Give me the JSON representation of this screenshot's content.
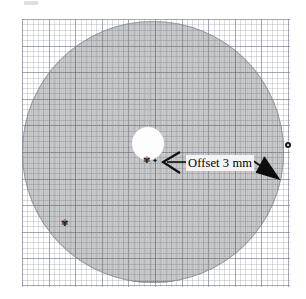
{
  "figure": {
    "caption_text": "",
    "background_color": "#ffffff"
  },
  "annotation": {
    "label": "Offset 3 mm",
    "label_background": "#f4f4f4",
    "label_color": "#000000",
    "left_arrow_name": "arrow-to-hole-edge",
    "right_arrow_name": "arrow-to-disc-edge"
  },
  "grid": {
    "name": "graph-paper-grid",
    "minor_spacing_px": 5.32,
    "major_spacing_px": 26.6,
    "minor_color": "#969ba5",
    "major_color": "#787d87"
  },
  "disc": {
    "name": "specimen-disc",
    "fill_color": "#a8aaac",
    "edge_color": "#828488",
    "center_x": 153,
    "center_y": 152,
    "radius_px": 131
  },
  "hole": {
    "name": "center-hole",
    "fill_color": "#fdfdfd",
    "center_x": 148,
    "center_y": 143,
    "radius_px": 16
  },
  "markers": {
    "speck_a": "✾",
    "speck_b": "✦",
    "speck_c": "✾",
    "edge_dot_color": "#1d1d1d"
  },
  "artifact": {
    "top_bar_color": "#d9d9d9"
  }
}
